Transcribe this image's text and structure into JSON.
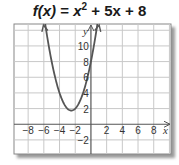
{
  "chart_data": {
    "type": "line",
    "title_parts": {
      "fx": "f(x)",
      "eq": " = ",
      "x": "x",
      "exp": "2",
      "rest": " + 5x + 8"
    },
    "function": "x^2 + 5x + 8",
    "xlabel": "x",
    "ylabel": "y",
    "xlim": [
      -9.8,
      10.2
    ],
    "ylim": [
      -3.8,
      12.8
    ],
    "grid": true,
    "x_ticks": [
      -8,
      -6,
      -4,
      -2,
      2,
      4,
      6,
      8
    ],
    "x_tick_labels": [
      "−8",
      "−6",
      "−4",
      "−2",
      "2",
      "4",
      "6",
      "8"
    ],
    "y_ticks": [
      10,
      8,
      6,
      4,
      2,
      -2
    ],
    "y_tick_labels": [
      "10",
      "8",
      "6",
      "4",
      "2",
      "−2"
    ],
    "vertex": {
      "x": -2.5,
      "y": 1.75
    },
    "series": [
      {
        "name": "f(x)",
        "x": [
          -6.3,
          -6,
          -5,
          -4,
          -3,
          -2.5,
          -2,
          -1,
          0,
          1.3
        ],
        "values": [
          16.19,
          14,
          8,
          4,
          2,
          1.75,
          2,
          4,
          8,
          16.19
        ]
      }
    ],
    "curve_color": "#555555",
    "grid_color": "#c8c8c8",
    "axis_color": "#555555"
  }
}
